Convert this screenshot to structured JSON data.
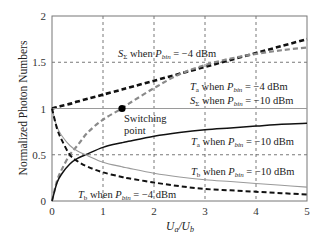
{
  "chart_data": {
    "type": "line",
    "title": "",
    "xlabel": "U_a/U_b",
    "ylabel": "Normalized Photon Numbers",
    "xlim": [
      0,
      5
    ],
    "ylim": [
      0,
      2
    ],
    "xticks": [
      "0",
      "1",
      "2",
      "3",
      "4",
      "5"
    ],
    "yticks": [
      "0",
      "0.5",
      "1",
      "1.5",
      "2"
    ],
    "grid": true,
    "legend_position": "inline annotations",
    "x": [
      0,
      0.1,
      0.2,
      0.35,
      0.5,
      0.7,
      1,
      1.37,
      1.5,
      2,
      2.5,
      3,
      3.5,
      4,
      4.5,
      5
    ],
    "series": [
      {
        "name": "S_Σ when P_bin = −4 dBm",
        "style": "black-thick-dashed",
        "values": [
          1.0,
          1.015,
          1.03,
          1.05,
          1.075,
          1.105,
          1.15,
          1.205,
          1.225,
          1.3,
          1.375,
          1.45,
          1.525,
          1.6,
          1.675,
          1.75
        ]
      },
      {
        "name": "T_a when P_bin = −4 dBm",
        "style": "gray-dashed",
        "values": [
          0.0,
          0.22,
          0.35,
          0.5,
          0.6,
          0.74,
          0.88,
          1.0,
          1.05,
          1.22,
          1.37,
          1.47,
          1.54,
          1.59,
          1.63,
          1.66
        ]
      },
      {
        "name": "S_Σ when P_bin = −10 dBm",
        "style": "gray-solid",
        "values": [
          1.0,
          1.0,
          1.0,
          1.0,
          1.0,
          1.0,
          1.0,
          1.0,
          1.0,
          1.0,
          1.0,
          1.0,
          1.0,
          1.0,
          1.0,
          1.0
        ]
      },
      {
        "name": "T_a when P_bin = −10 dBm",
        "style": "black-solid",
        "values": [
          0.0,
          0.2,
          0.3,
          0.4,
          0.46,
          0.51,
          0.58,
          0.63,
          0.645,
          0.7,
          0.74,
          0.77,
          0.79,
          0.81,
          0.83,
          0.84
        ]
      },
      {
        "name": "T_b when P_bin = −10 dBm",
        "style": "gray-solid-thin",
        "values": [
          1.0,
          0.8,
          0.7,
          0.6,
          0.54,
          0.49,
          0.42,
          0.37,
          0.355,
          0.3,
          0.26,
          0.23,
          0.21,
          0.19,
          0.17,
          0.15
        ]
      },
      {
        "name": "T_b when P_bin = −4 dBm",
        "style": "black-dashed",
        "values": [
          1.0,
          0.78,
          0.65,
          0.5,
          0.43,
          0.37,
          0.31,
          0.26,
          0.245,
          0.2,
          0.16,
          0.13,
          0.115,
          0.1,
          0.085,
          0.07
        ]
      }
    ],
    "annotations": [
      {
        "text": "Switching point",
        "x": 1.37,
        "y": 1.0
      }
    ]
  },
  "labels": {
    "s_sigma_m4": {
      "sym": "S",
      "sub": "Σ",
      "mid": " when ",
      "p": "P",
      "psub": "bin",
      "val": " = −4 dBm"
    },
    "ta_m4": {
      "sym": "T",
      "sub": "a",
      "mid": " when ",
      "p": "P",
      "psub": "bin",
      "val": " = −4 dBm"
    },
    "s_sigma_m10": {
      "sym": "S",
      "sub": "Σ",
      "mid": " when ",
      "p": "P",
      "psub": "bin",
      "val": " = −10 dBm"
    },
    "ta_m10": {
      "sym": "T",
      "sub": "a",
      "mid": " when ",
      "p": "P",
      "psub": "bin",
      "val": " = −10 dBm"
    },
    "tb_m10": {
      "sym": "T",
      "sub": "b",
      "mid": " when ",
      "p": "P",
      "psub": "bin",
      "val": " = −10 dBm"
    },
    "tb_m4": {
      "sym": "T",
      "sub": "b",
      "mid": " when ",
      "p": "P",
      "psub": "bin",
      "val": " = −4 dBm"
    },
    "switch1": "Switching",
    "switch2": "point",
    "xlabel_u": "U",
    "xlabel_a": "a",
    "xlabel_slash": "/U",
    "xlabel_b": "b",
    "ylabel": "Normalized Photon Numbers"
  },
  "colors": {
    "black": "#111111",
    "gray": "#8a8a8a",
    "grid": "#555555",
    "axis": "#777777"
  }
}
